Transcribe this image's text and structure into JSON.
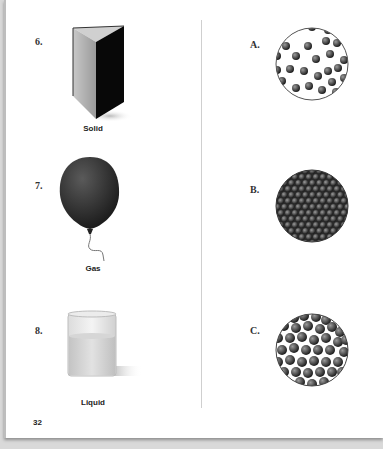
{
  "page": {
    "page_number": "32",
    "left_column": [
      {
        "number": "6.",
        "image": "solid-wedge-block-icon",
        "caption": "Solid"
      },
      {
        "number": "7.",
        "image": "balloon-icon",
        "caption": "Gas"
      },
      {
        "number": "8.",
        "image": "beaker-liquid-icon",
        "caption": "Liquid"
      }
    ],
    "right_column": [
      {
        "letter": "A.",
        "image": "particles-spread-apart-icon"
      },
      {
        "letter": "B.",
        "image": "particles-tightly-packed-icon"
      },
      {
        "letter": "C.",
        "image": "particles-close-random-icon"
      }
    ]
  }
}
